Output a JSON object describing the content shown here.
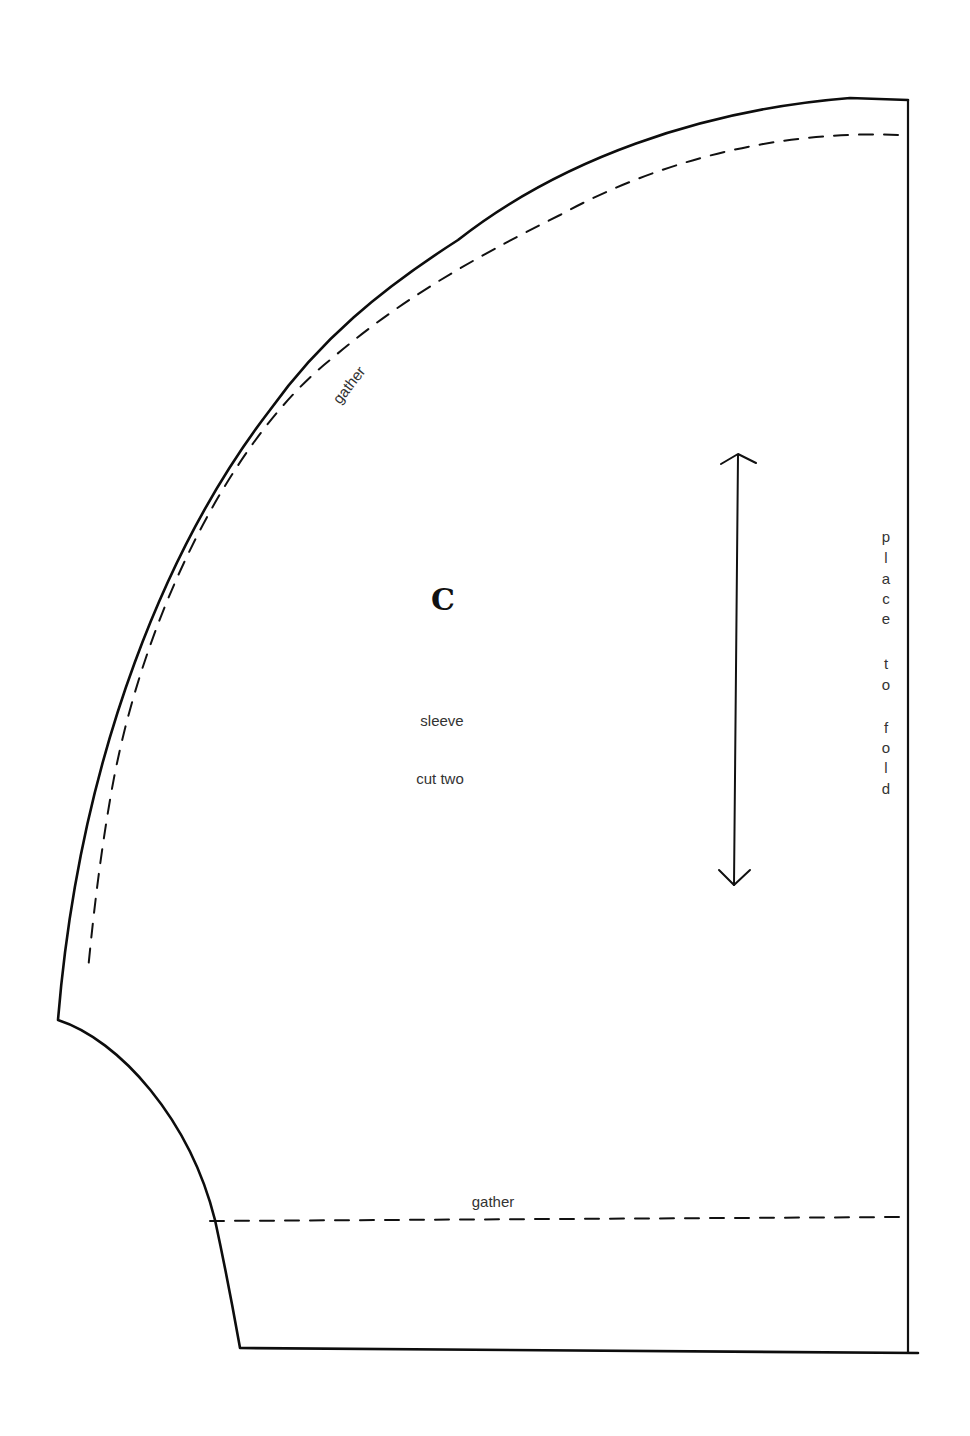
{
  "pattern_piece": {
    "piece_letter": "C",
    "piece_name": "sleeve",
    "cut_instruction": "cut two",
    "fold_instruction": "place to fold",
    "fold_letters": [
      "p",
      "l",
      "a",
      "c",
      "e",
      "",
      "t",
      "o",
      "",
      "f",
      "o",
      "l",
      "d"
    ],
    "gather_label_top": "gather",
    "gather_label_bottom": "gather",
    "grainline": "double-headed vertical arrow"
  },
  "colors": {
    "line": "#111111",
    "text": "#333333",
    "background": "#ffffff"
  }
}
